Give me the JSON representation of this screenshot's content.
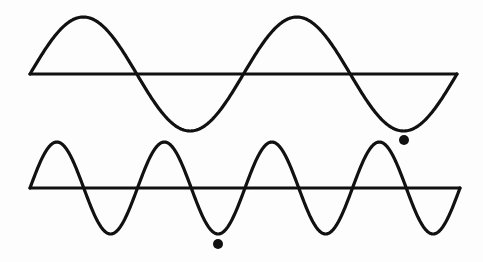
{
  "diagram": {
    "title": "Two sine waves: lower wave has twice the frequency (half the wavelength) of upper wave",
    "stroke_color": "#111111",
    "background": "#fdfdfd",
    "waves": [
      {
        "name": "upper-wave",
        "axis": {
          "x1": 30,
          "x2": 457,
          "y": 74
        },
        "amplitude": 57,
        "cycles": 2,
        "marker_dot": {
          "cx": 404,
          "cy": 140,
          "r": 5
        }
      },
      {
        "name": "lower-wave",
        "axis": {
          "x1": 30,
          "x2": 460,
          "y": 188
        },
        "amplitude": 46,
        "cycles": 4,
        "marker_dot": {
          "cx": 218,
          "cy": 244,
          "r": 5
        }
      }
    ]
  }
}
